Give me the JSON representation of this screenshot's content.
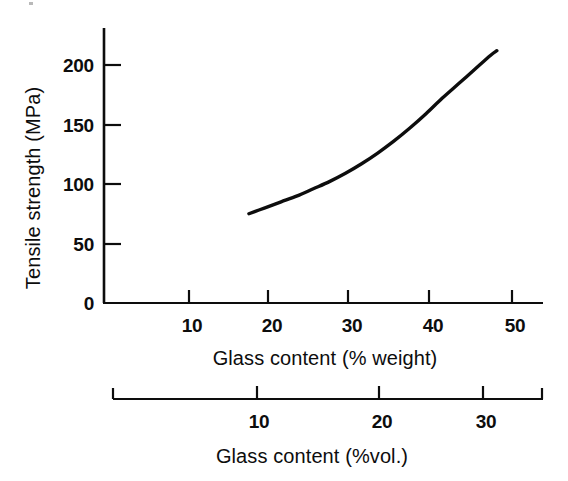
{
  "figure": {
    "background_color": "#ffffff",
    "ink_color": "#0d0d0d"
  },
  "chart_data": {
    "type": "line",
    "title": "",
    "subtitle": "",
    "xlabel": "Glass content (% weight)",
    "ylabel": "Tensile strength (MPa)",
    "secondary_xlabel": "Glass content (%vol.)",
    "xlim": [
      0,
      55
    ],
    "ylim": [
      0,
      230
    ],
    "secondary_xlim": [
      0,
      36
    ],
    "grid": false,
    "legend": false,
    "legend_position": "none",
    "y_ticks": [
      0,
      50,
      100,
      150,
      200
    ],
    "y_tick_labels": [
      "0",
      "50",
      "100",
      "150",
      "200"
    ],
    "x_ticks": [
      10,
      20,
      30,
      40,
      50
    ],
    "x_tick_labels": [
      "10",
      "20",
      "30",
      "40",
      "50"
    ],
    "secondary_x_ticks": [
      10,
      20,
      30
    ],
    "secondary_x_tick_labels": [
      "10",
      "20",
      "30"
    ],
    "series": [
      {
        "name": "Tensile strength vs glass content",
        "x_unit": "% weight",
        "y_unit": "MPa",
        "x": [
          18,
          20,
          22,
          24,
          26,
          28,
          30,
          32,
          34,
          36,
          38,
          40,
          42,
          44,
          46,
          48,
          48.8
        ],
        "values": [
          75,
          80,
          85,
          90,
          96,
          102,
          109,
          117,
          126,
          136,
          147,
          159,
          172,
          184,
          196,
          208,
          212
        ]
      }
    ],
    "annotations": []
  },
  "geometry": {
    "origin_x": 104,
    "origin_y": 303,
    "y_axis_top": 28,
    "x_axis_right": 543,
    "px_per_x_unit": 8.05,
    "px_per_y_unit": 1.19,
    "secondary_axis_y": 399,
    "secondary_axis_left": 113,
    "secondary_axis_right": 543,
    "secondary_px_per_unit": 11.95
  }
}
